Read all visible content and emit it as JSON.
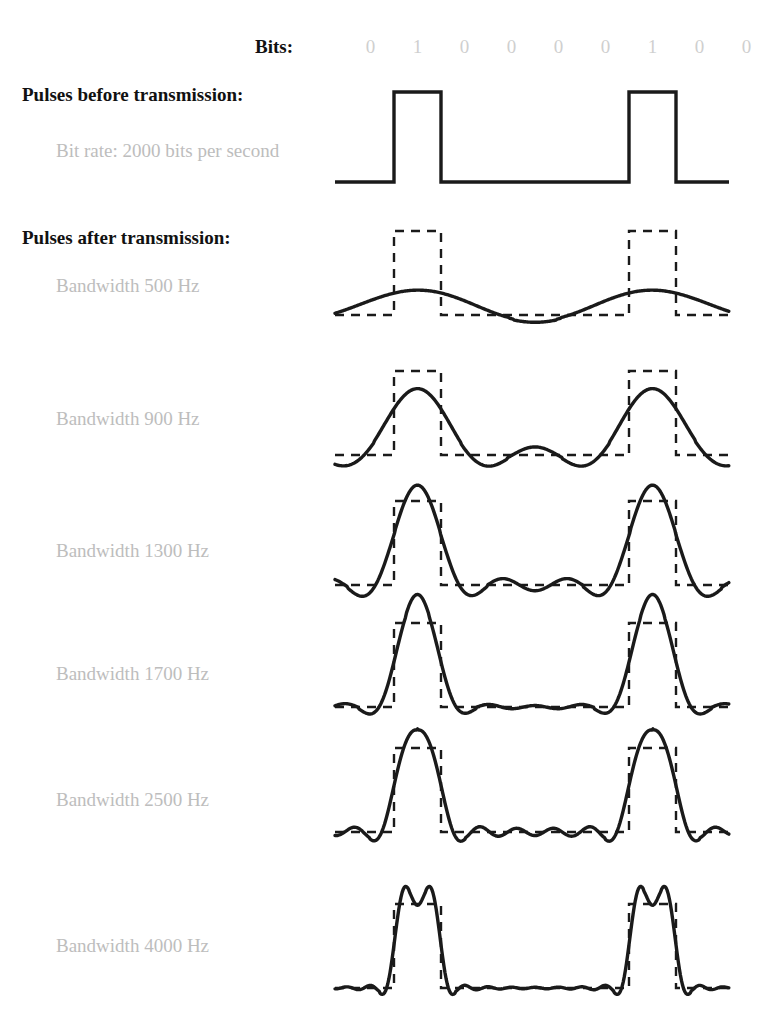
{
  "bits_row": {
    "title": "Bits:",
    "digits": [
      "0",
      "1",
      "0",
      "0",
      "0",
      "0",
      "1",
      "0",
      "0"
    ]
  },
  "sections": [
    {
      "heading": "Pulses before transmission:",
      "sub_label": "Bit rate:  2000 bits per second"
    },
    {
      "heading": "Pulses after transmission:",
      "sub_label": "Bandwidth 500 Hz"
    }
  ],
  "bandwidth_labels": [
    "Bandwidth 500 Hz",
    "Bandwidth 900 Hz",
    "Bandwidth 1300 Hz",
    "Bandwidth 1700 Hz",
    "Bandwidth 2500 Hz",
    "Bandwidth 4000 Hz"
  ],
  "colors": {
    "ink": "#1a1a1a",
    "heading": "#111111",
    "muted_label": "#bdbdbd",
    "bit_digit": "#cfcfcf",
    "background": "#ffffff"
  },
  "chart_data": {
    "type": "line",
    "xlabel": "",
    "ylabel": "",
    "grid": false,
    "legend_position": "none",
    "bit_sequence": [
      0,
      1,
      0,
      0,
      0,
      0,
      1,
      0,
      0
    ],
    "bit_rate_bps": 2000,
    "bit_period_px": 47,
    "first_bit_left_px": 347,
    "trace_left_px": 335,
    "trace_right_px": 729,
    "square_wave": {
      "name": "Pulses before transmission",
      "baseline_y": 182,
      "high_y": 92,
      "style": "solid",
      "pulse_bit_indices": [
        1,
        6
      ]
    },
    "reference_pulse_style": "dashed",
    "series": [
      {
        "name": "Bandwidth 500 Hz",
        "bandwidth_hz": 500,
        "harmonics": 1,
        "baseline_y": 315,
        "amplitude_px": 84,
        "peak_fraction_of_pulse": 0.55,
        "ripple_count_between_pulses": 0
      },
      {
        "name": "Bandwidth 900 Hz",
        "bandwidth_hz": 900,
        "harmonics": 2,
        "baseline_y": 455,
        "amplitude_px": 84,
        "peak_fraction_of_pulse": 0.93,
        "ripple_count_between_pulses": 1
      },
      {
        "name": "Bandwidth 1300 Hz",
        "bandwidth_hz": 1300,
        "harmonics": 3,
        "baseline_y": 585,
        "amplitude_px": 84,
        "peak_fraction_of_pulse": 1.12,
        "ripple_count_between_pulses": 2
      },
      {
        "name": "Bandwidth 1700 Hz",
        "bandwidth_hz": 1700,
        "harmonics": 4,
        "baseline_y": 707,
        "amplitude_px": 84,
        "peak_fraction_of_pulse": 1.15,
        "ripple_count_between_pulses": 3
      },
      {
        "name": "Bandwidth 2500 Hz",
        "bandwidth_hz": 2500,
        "harmonics": 6,
        "baseline_y": 832,
        "amplitude_px": 84,
        "peak_fraction_of_pulse": 1.1,
        "ripple_count_between_pulses": 4
      },
      {
        "name": "Bandwidth 4000 Hz",
        "bandwidth_hz": 4000,
        "harmonics": 10,
        "baseline_y": 988,
        "amplitude_px": 84,
        "peak_fraction_of_pulse": 1.08,
        "ripple_count_between_pulses": 7
      }
    ]
  }
}
